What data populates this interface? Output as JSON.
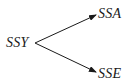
{
  "diagram": {
    "type": "branching-arrow",
    "nodes": {
      "source": {
        "label": "SSY"
      },
      "top": {
        "label": "SSA"
      },
      "bottom": {
        "label": "SSE"
      }
    },
    "edges": [
      {
        "from": "SSY",
        "to": "SSA"
      },
      {
        "from": "SSY",
        "to": "SSE"
      }
    ],
    "colors": {
      "line": "#1a1a1a",
      "text": "#1a1a1a",
      "background": "#ffffff"
    }
  }
}
